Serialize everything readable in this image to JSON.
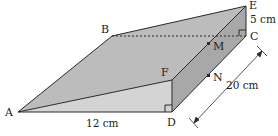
{
  "figure": {
    "type": "triangular-prism-wedge",
    "colors": {
      "top_face": "#bdbdbd",
      "front_face": "#d3d3d3",
      "side_face": "#a9a9a9",
      "edge": "#2a2a2a",
      "background": "#ffffff"
    },
    "vertices": {
      "A": "A",
      "B": "B",
      "C": "C",
      "D": "D",
      "E": "E",
      "F": "F",
      "M": "M",
      "N": "N"
    },
    "dimensions": {
      "AD": "12 cm",
      "EC": "5 cm",
      "CD": "20 cm"
    }
  }
}
